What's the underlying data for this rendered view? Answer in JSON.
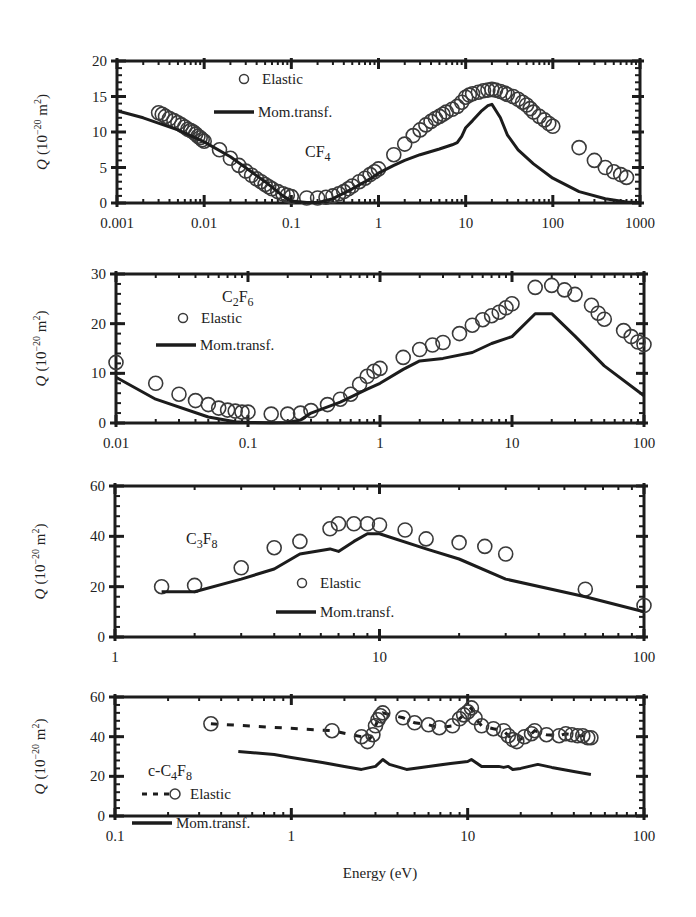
{
  "figure": {
    "xlabel": "Energy (eV)",
    "ylabel_prefix": "Q",
    "ylabel_units": "(10",
    "ylabel_exp": "−20",
    "ylabel_m": " m",
    "ylabel_m_exp": "2",
    "ylabel_close": ")"
  },
  "chart_data": [
    {
      "type": "line",
      "title": "CF4",
      "molecule": {
        "base": "CF",
        "sub": "4",
        "prefix": ""
      },
      "xlabel": "",
      "ylabel": "Q (10^-20 m^2)",
      "xscale": "log",
      "xlim": [
        0.001,
        1000
      ],
      "ylim": [
        0,
        20
      ],
      "xticks": [
        "0.001",
        "0.01",
        "0.1",
        "1",
        "10",
        "100",
        "1000"
      ],
      "xtick_values": [
        0.001,
        0.01,
        0.1,
        1,
        10,
        100,
        1000
      ],
      "yticks": [
        0,
        5,
        10,
        15,
        20
      ],
      "box": {
        "x0": 117,
        "x1": 640,
        "y0": 61,
        "y1": 203
      },
      "legend": [
        {
          "label": "Elastic",
          "marker": "circle",
          "x": 244,
          "y": 84
        },
        {
          "label": "Mom.transf.",
          "marker": "line",
          "x": 224,
          "y": 117
        }
      ],
      "mol_label_pos": {
        "x": 305,
        "y": 157
      },
      "series": [
        {
          "name": "Elastic",
          "style": "circle",
          "x": [
            0.003,
            0.0033,
            0.0036,
            0.004,
            0.0045,
            0.005,
            0.0055,
            0.006,
            0.0065,
            0.007,
            0.0075,
            0.008,
            0.0085,
            0.009,
            0.0095,
            0.01,
            0.015,
            0.02,
            0.025,
            0.03,
            0.035,
            0.04,
            0.045,
            0.05,
            0.055,
            0.06,
            0.07,
            0.08,
            0.09,
            0.1,
            0.15,
            0.2,
            0.25,
            0.3,
            0.35,
            0.4,
            0.45,
            0.5,
            0.6,
            0.7,
            0.8,
            0.9,
            1.0,
            1.5,
            2,
            2.5,
            3,
            3.5,
            4,
            4.5,
            5,
            5.5,
            6,
            7,
            8,
            9,
            10,
            11,
            12,
            14,
            16,
            18,
            20,
            22,
            25,
            28,
            30,
            35,
            40,
            45,
            50,
            55,
            60,
            70,
            80,
            90,
            100,
            200,
            300,
            400,
            500,
            600,
            700
          ],
          "y": [
            12.7,
            12.5,
            12.2,
            11.9,
            11.6,
            11.3,
            11.0,
            10.7,
            10.4,
            10.2,
            10.0,
            9.7,
            9.4,
            9.2,
            8.9,
            8.7,
            7.5,
            6.3,
            5.3,
            4.5,
            3.9,
            3.4,
            3.0,
            2.6,
            2.3,
            2.0,
            1.6,
            1.3,
            1.1,
            0.9,
            0.7,
            0.7,
            0.8,
            1.0,
            1.3,
            1.6,
            2.0,
            2.4,
            3.0,
            3.5,
            4.0,
            4.4,
            4.8,
            6.8,
            8.3,
            9.5,
            10.3,
            11.0,
            11.5,
            11.9,
            12.2,
            12.5,
            12.8,
            13.2,
            13.6,
            14.2,
            14.9,
            15.2,
            15.4,
            15.6,
            15.8,
            15.9,
            16.0,
            15.9,
            15.7,
            15.5,
            15.3,
            15.0,
            14.6,
            14.2,
            13.8,
            13.3,
            12.8,
            12.2,
            11.7,
            11.2,
            10.8,
            7.8,
            6.0,
            5.0,
            4.4,
            4.0,
            3.6
          ]
        },
        {
          "name": "Mom.transf.",
          "style": "line",
          "x": [
            0.001,
            0.002,
            0.005,
            0.01,
            0.02,
            0.05,
            0.08,
            0.1,
            0.15,
            0.2,
            0.3,
            0.5,
            0.8,
            1,
            1.5,
            2,
            3,
            5,
            7,
            8,
            9,
            10,
            12,
            15,
            18,
            20,
            25,
            30,
            40,
            60,
            100,
            200,
            400,
            700,
            1000
          ],
          "y": [
            13.0,
            12.0,
            10.3,
            8.6,
            6.5,
            3.0,
            1.0,
            0.3,
            0.05,
            0.05,
            0.6,
            2.0,
            3.4,
            4.2,
            5.3,
            6.0,
            6.8,
            7.6,
            8.2,
            8.5,
            9.4,
            10.6,
            11.6,
            12.9,
            13.7,
            13.9,
            12.0,
            9.6,
            7.5,
            5.5,
            3.5,
            1.6,
            0.6,
            0.15,
            0.05
          ]
        }
      ]
    },
    {
      "type": "line",
      "title": "C2F6",
      "molecule": {
        "base": "C",
        "sub": "2",
        "base2": "F",
        "sub2": "6",
        "prefix": ""
      },
      "xscale": "log",
      "xlim": [
        0.01,
        100
      ],
      "ylim": [
        0,
        30
      ],
      "xticks": [
        "0.01",
        "0.1",
        "1",
        "10",
        "100"
      ],
      "xtick_values": [
        0.01,
        0.1,
        1,
        10,
        100
      ],
      "yticks": [
        0,
        10,
        20,
        30
      ],
      "box": {
        "x0": 116,
        "x1": 644,
        "y0": 274,
        "y1": 423
      },
      "legend": [
        {
          "label": "Elastic",
          "marker": "circle",
          "x": 183,
          "y": 323
        },
        {
          "label": "Mom.transf.",
          "marker": "line",
          "x": 166,
          "y": 350
        }
      ],
      "mol_label_pos": {
        "x": 222,
        "y": 302
      },
      "series": [
        {
          "name": "Elastic",
          "style": "circle",
          "x": [
            0.01,
            0.02,
            0.03,
            0.04,
            0.05,
            0.06,
            0.07,
            0.08,
            0.09,
            0.1,
            0.15,
            0.2,
            0.25,
            0.3,
            0.4,
            0.5,
            0.6,
            0.7,
            0.8,
            0.9,
            1.0,
            1.5,
            2,
            2.5,
            3,
            4,
            5,
            6,
            7,
            8,
            9,
            10,
            15,
            20,
            25,
            30,
            40,
            45,
            50,
            70,
            80,
            90,
            100
          ],
          "y": [
            12.2,
            8.0,
            5.8,
            4.5,
            3.7,
            3.0,
            2.6,
            2.4,
            2.2,
            2.2,
            1.8,
            1.8,
            2.0,
            2.5,
            3.7,
            4.8,
            5.8,
            7.8,
            9.4,
            10.4,
            11.0,
            13.2,
            14.8,
            15.7,
            16.2,
            18.0,
            19.7,
            20.8,
            21.6,
            22.3,
            23.2,
            24.0,
            27.3,
            27.7,
            26.8,
            25.9,
            23.7,
            22.1,
            20.9,
            18.6,
            17.4,
            16.3,
            15.8
          ]
        },
        {
          "name": "Mom.transf.",
          "style": "line",
          "x": [
            0.01,
            0.02,
            0.05,
            0.08,
            0.1,
            0.15,
            0.2,
            0.25,
            0.3,
            0.5,
            0.8,
            1,
            1.5,
            2,
            3,
            5,
            7,
            10,
            15,
            20,
            30,
            50,
            100
          ],
          "y": [
            9.2,
            4.8,
            1.2,
            0.25,
            0.1,
            0.05,
            0.1,
            0.6,
            2.0,
            4.2,
            6.8,
            8.0,
            10.8,
            12.5,
            13.0,
            14.2,
            16.0,
            17.4,
            22.0,
            22.0,
            17.5,
            11.5,
            5.5
          ]
        }
      ]
    },
    {
      "type": "line",
      "title": "C3F8",
      "molecule": {
        "base": "C",
        "sub": "3",
        "base2": "F",
        "sub2": "8",
        "prefix": ""
      },
      "xscale": "log",
      "xlim": [
        1,
        100
      ],
      "ylim": [
        0,
        60
      ],
      "xticks": [
        "1",
        "10",
        "100"
      ],
      "xtick_values": [
        1,
        10,
        100
      ],
      "yticks": [
        0,
        20,
        40,
        60
      ],
      "box": {
        "x0": 115,
        "x1": 644,
        "y0": 486,
        "y1": 637
      },
      "legend": [
        {
          "label": "Elastic",
          "marker": "circle",
          "x": 302,
          "y": 588
        },
        {
          "label": "Mom.transf.",
          "marker": "line",
          "x": 286,
          "y": 617
        }
      ],
      "mol_label_pos": {
        "x": 186,
        "y": 544
      },
      "series": [
        {
          "name": "Elastic",
          "style": "circle",
          "x": [
            1.5,
            2,
            3,
            4,
            5,
            6.5,
            7,
            8,
            9,
            10,
            12.5,
            15,
            20,
            25,
            30,
            60,
            100
          ],
          "y": [
            20,
            20.5,
            27.5,
            35.5,
            38,
            43,
            45,
            45,
            45,
            44.5,
            42.5,
            39,
            37.5,
            36,
            33,
            19,
            12.5
          ]
        },
        {
          "name": "Mom.transf.",
          "style": "line",
          "x": [
            1.5,
            2,
            3,
            4,
            5,
            6.5,
            7,
            8,
            9,
            10,
            15,
            20,
            30,
            60,
            100
          ],
          "y": [
            18,
            18,
            23,
            27,
            33,
            35,
            34,
            38,
            41,
            41,
            35,
            31,
            23,
            16,
            10
          ]
        }
      ]
    },
    {
      "type": "line",
      "title": "c-C4F8",
      "molecule": {
        "base": "C",
        "sub": "4",
        "base2": "F",
        "sub2": "8",
        "prefix": "c-"
      },
      "xlabel": "Energy (eV)",
      "xscale": "log",
      "xlim": [
        0.1,
        100
      ],
      "ylim": [
        0,
        60
      ],
      "xticks": [
        "0.1",
        "1",
        "10",
        "100"
      ],
      "xtick_values": [
        0.1,
        1,
        10,
        100
      ],
      "yticks": [
        0,
        20,
        40,
        60
      ],
      "box": {
        "x0": 115,
        "x1": 644,
        "y0": 697,
        "y1": 816
      },
      "legend": [
        {
          "label": "Elastic",
          "marker": "dashed-circle",
          "x": 150,
          "y": 799
        },
        {
          "label": "Mom.transf.",
          "marker": "line",
          "x": 142,
          "y": 828
        }
      ],
      "mol_label_pos": {
        "x": 148,
        "y": 776
      },
      "series": [
        {
          "name": "Elastic",
          "style": "circle-dashed",
          "x": [
            0.35,
            1.7,
            2.5,
            2.7,
            2.9,
            3.0,
            3.1,
            3.2,
            3.3,
            4.3,
            5.0,
            6.0,
            6.9,
            8.2,
            9.0,
            9.5,
            10.0,
            10.5,
            11.0,
            12.0,
            14.0,
            16.0,
            17.0,
            18.0,
            19.0,
            21.0,
            23.0,
            24.0,
            28.0,
            33.0,
            36.0,
            39.0,
            42.0,
            45.0,
            48.0,
            50.0
          ],
          "y": [
            46.5,
            43,
            40,
            37.5,
            41,
            45.5,
            48.5,
            50.5,
            52,
            49.5,
            47,
            46,
            44.5,
            45.5,
            49,
            51,
            52.5,
            54.5,
            49.5,
            45.5,
            44,
            43,
            40.5,
            38.5,
            37.5,
            40,
            41.5,
            43,
            41,
            40.5,
            41.5,
            41,
            40.5,
            40.5,
            39.5,
            39.5
          ]
        },
        {
          "name": "Mom.transf.",
          "style": "line",
          "x": [
            0.5,
            0.8,
            1.0,
            1.5,
            2.0,
            2.5,
            3.0,
            3.3,
            3.6,
            4.5,
            6,
            8,
            10,
            10.5,
            12,
            15,
            16,
            17,
            18,
            20,
            25,
            30,
            40,
            50
          ],
          "y": [
            32.5,
            31,
            29.5,
            27,
            25,
            23.5,
            25,
            28.5,
            26,
            23.5,
            25,
            26.5,
            27.5,
            28.5,
            25,
            25,
            24.5,
            25,
            23.5,
            24,
            26,
            24.5,
            22.5,
            21
          ]
        }
      ]
    }
  ]
}
